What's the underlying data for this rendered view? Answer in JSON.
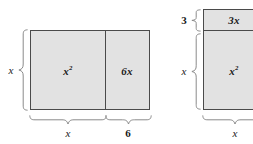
{
  "diagram": {
    "colors": {
      "fill": "#e2e2e2",
      "border": "#4a4a4a",
      "brace": "#8a8a8a",
      "text": "#1a1a1a",
      "background": "#ffffff"
    },
    "figures": [
      {
        "id": "left-figure",
        "name": "x-squared-plus-6x-horizontal",
        "orientation": "horizontal-split",
        "cells": [
          {
            "id": "left-cell-area",
            "label": "x",
            "exponent": "2",
            "display": "x²"
          },
          {
            "id": "left-cell-product",
            "label": "6x",
            "exponent": "",
            "display": "6x"
          }
        ],
        "dimensions": [
          {
            "id": "left-height",
            "label": "x",
            "style": "italic",
            "side": "left"
          },
          {
            "id": "left-width-first",
            "label": "x",
            "style": "italic",
            "side": "bottom"
          },
          {
            "id": "left-width-second",
            "label": "6",
            "style": "upright",
            "side": "bottom"
          }
        ]
      },
      {
        "id": "right-figure",
        "name": "x-squared-plus-3x-vertical",
        "orientation": "vertical-split",
        "cells": [
          {
            "id": "right-cell-product",
            "label": "3x",
            "exponent": "",
            "display": "3x"
          },
          {
            "id": "right-cell-area",
            "label": "x",
            "exponent": "2",
            "display": "x²"
          }
        ],
        "dimensions": [
          {
            "id": "right-height-top",
            "label": "3",
            "style": "upright",
            "side": "left"
          },
          {
            "id": "right-height-bottom",
            "label": "x",
            "style": "italic",
            "side": "left"
          },
          {
            "id": "right-width",
            "label": "x",
            "style": "italic",
            "side": "bottom"
          }
        ]
      }
    ]
  }
}
